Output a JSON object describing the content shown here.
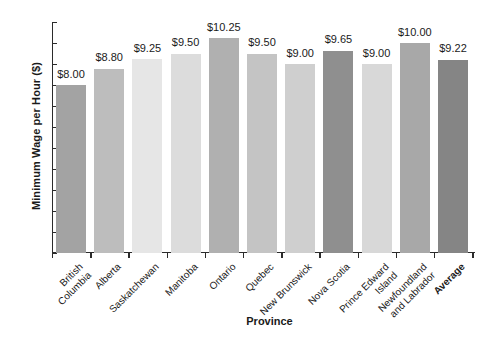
{
  "chart_data": {
    "type": "bar",
    "title": "",
    "xlabel": "Province",
    "ylabel": "Minimum Wage per Hour ($)",
    "ylim": [
      0,
      11
    ],
    "ytick_step": 1,
    "yticks": [
      "11",
      "10",
      "9",
      "8",
      "7",
      "6",
      "5",
      "4",
      "3",
      "2",
      "1",
      "0"
    ],
    "grid": false,
    "legend": "none",
    "categories": [
      "British Columbia",
      "Alberta",
      "Saskatchewan",
      "Manitoba",
      "Ontario",
      "Quebec",
      "New Brunswick",
      "Nova Scotia",
      "Prince Edward Island",
      "Newfoundland and Labrador",
      "Average"
    ],
    "category_lines": [
      [
        "British",
        "Columbia"
      ],
      [
        "Alberta"
      ],
      [
        "Saskatchewan"
      ],
      [
        "Manitoba"
      ],
      [
        "Ontario"
      ],
      [
        "Quebec"
      ],
      [
        "New Brunswick"
      ],
      [
        "Nova Scotia"
      ],
      [
        "Prince Edward",
        "Island"
      ],
      [
        "Newfoundland",
        "and Labrador"
      ],
      [
        "Average"
      ]
    ],
    "category_bold": [
      false,
      false,
      false,
      false,
      false,
      false,
      false,
      false,
      false,
      false,
      true
    ],
    "values": [
      8.0,
      8.8,
      9.25,
      9.5,
      10.25,
      9.5,
      9.0,
      9.65,
      9.0,
      10.0,
      9.22
    ],
    "value_labels": [
      "$8.00",
      "$8.80",
      "$9.25",
      "$9.50",
      "$10.25",
      "$9.50",
      "$9.00",
      "$9.65",
      "$9.00",
      "$10.00",
      "$9.22"
    ],
    "bar_colors": [
      "#a3a3a3",
      "#bdbdbd",
      "#e6e6e6",
      "#dcdcdc",
      "#b0b0b0",
      "#c4c4c4",
      "#cfcfcf",
      "#8f8f8f",
      "#d8d8d8",
      "#a8a8a8",
      "#858585"
    ],
    "axis_color": "#2b2b2b",
    "text_color": "#1a1a1a",
    "background": "#ffffff"
  }
}
